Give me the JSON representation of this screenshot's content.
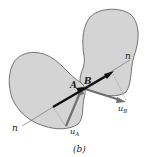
{
  "figure": {
    "caption": "(b)",
    "colors": {
      "body_fill": "#d4d4d4",
      "body_stroke": "#555555",
      "normal_arrow": "#111111",
      "velocity_arrow": "#707070",
      "construction_line": "#666666"
    },
    "labels": {
      "point_a": "A",
      "point_b": "B",
      "normal_start": "n",
      "normal_end": "n",
      "velocity_a": "u",
      "velocity_a_sub": "A",
      "velocity_b": "u",
      "velocity_b_sub": "B"
    }
  }
}
